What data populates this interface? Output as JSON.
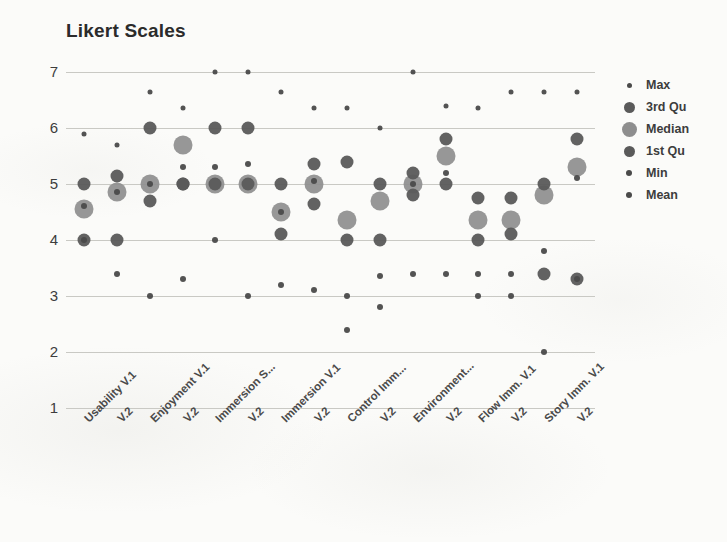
{
  "chart_data": {
    "type": "scatter",
    "title": "Likert Scales",
    "xlabel": "",
    "ylabel": "",
    "ylim": [
      1,
      7
    ],
    "yticks": [
      1,
      2,
      3,
      4,
      5,
      6,
      7
    ],
    "grid": true,
    "legend_position": "right",
    "categories": [
      "Usability V.1",
      "V.2",
      "Enjoyment V.1",
      "V.2",
      "Immersion S...",
      "V.2",
      "Immersion V.1",
      "V.2",
      "Control Imm...",
      "V.2",
      "Environment...",
      "V.2",
      "Flow Imm. V.1",
      "V.2",
      "Story Imm. V.1",
      "V.2"
    ],
    "series": [
      {
        "name": "Max",
        "color": "#4a4a4a",
        "marker_size": 5,
        "values": [
          5.9,
          5.7,
          6.65,
          6.35,
          7,
          7,
          6.65,
          6.35,
          6.35,
          6.0,
          7,
          6.4,
          6.35,
          6.65,
          6.65,
          6.65
        ]
      },
      {
        "name": "3rd Qu",
        "color": "#5a5a5a",
        "marker_size": 13,
        "values": [
          5.0,
          5.15,
          6.0,
          5.0,
          6.0,
          6.0,
          5.0,
          5.35,
          5.4,
          5.0,
          5.2,
          5.8,
          4.75,
          4.75,
          5.0,
          5.8
        ]
      },
      {
        "name": "Median",
        "color": "#8e8e8e",
        "marker_size": 19,
        "values": [
          4.55,
          4.85,
          5.0,
          5.7,
          5.0,
          5.0,
          4.5,
          5.0,
          4.35,
          4.7,
          5.0,
          5.5,
          4.35,
          4.35,
          4.8,
          5.3
        ]
      },
      {
        "name": "1st Qu",
        "color": "#5a5a5a",
        "marker_size": 13,
        "values": [
          4.0,
          4.0,
          4.7,
          5.0,
          5.0,
          5.0,
          4.1,
          4.65,
          4.0,
          4.0,
          4.8,
          5.0,
          4.0,
          4.1,
          3.4,
          3.3
        ]
      },
      {
        "name": "Min",
        "color": "#4a4a4a",
        "marker_size": 6,
        "values": [
          4.0,
          3.4,
          3.0,
          3.3,
          4.0,
          3.0,
          3.2,
          3.1,
          3.0,
          2.8,
          3.4,
          3.4,
          3.0,
          3.0,
          2.0,
          3.3
        ]
      },
      {
        "name": "Mean",
        "color": "#4a4a4a",
        "marker_size": 6,
        "values": [
          4.6,
          4.85,
          5.0,
          5.3,
          5.3,
          5.35,
          4.5,
          5.05,
          2.4,
          3.35,
          5.0,
          5.2,
          3.4,
          3.4,
          3.8,
          5.1
        ]
      }
    ],
    "legend": [
      {
        "label": "Max",
        "color": "#4a4a4a",
        "size": 5
      },
      {
        "label": "3rd Qu",
        "color": "#5a5a5a",
        "size": 11
      },
      {
        "label": "Median",
        "color": "#8e8e8e",
        "size": 15
      },
      {
        "label": "1st Qu",
        "color": "#5a5a5a",
        "size": 11
      },
      {
        "label": "Min",
        "color": "#4a4a4a",
        "size": 6
      },
      {
        "label": "Mean",
        "color": "#4a4a4a",
        "size": 6
      }
    ]
  }
}
